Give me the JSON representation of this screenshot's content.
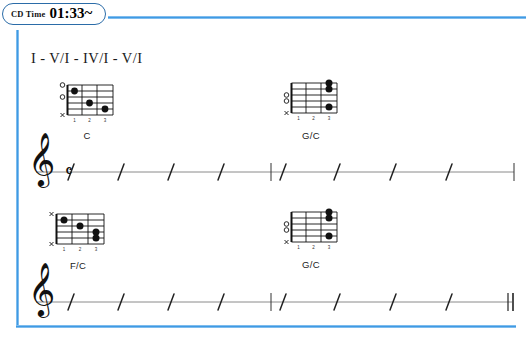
{
  "badge": {
    "label": "CD Time",
    "value": "01:33~",
    "icon": "cd-time-badge"
  },
  "colors": {
    "frame_blue": "#4da3e8",
    "ink": "#111111",
    "staff_line": "#8a8a8a"
  },
  "progression": {
    "text": "I - V/I - IV/I - V/I"
  },
  "chords": [
    {
      "name": "C",
      "row": 1,
      "position": "left",
      "markers": [
        "o",
        "o",
        "",
        "",
        "",
        "x"
      ],
      "fret_numbers": [
        "1",
        "2",
        "3"
      ],
      "dots": [
        {
          "string": 2,
          "fret": 1
        },
        {
          "string": 4,
          "fret": 2
        },
        {
          "string": 5,
          "fret": 3
        }
      ]
    },
    {
      "name": "G/C",
      "row": 1,
      "position": "right",
      "markers": [
        "",
        "",
        "o",
        "o",
        "",
        "x"
      ],
      "fret_numbers": [
        "1",
        "2",
        "3"
      ],
      "dots": [
        {
          "string": 1,
          "fret": 3
        },
        {
          "string": 2,
          "fret": 3
        },
        {
          "string": 5,
          "fret": 3
        }
      ]
    },
    {
      "name": "F/C",
      "row": 2,
      "position": "left",
      "markers": [
        "x",
        "",
        "",
        "",
        "",
        "x"
      ],
      "fret_numbers": [
        "1",
        "2",
        "3"
      ],
      "dots": [
        {
          "string": 2,
          "fret": 1
        },
        {
          "string": 3,
          "fret": 2
        },
        {
          "string": 4,
          "fret": 3
        },
        {
          "string": 5,
          "fret": 3
        }
      ]
    },
    {
      "name": "G/C",
      "row": 2,
      "position": "right",
      "markers": [
        "",
        "",
        "o",
        "o",
        "",
        "x"
      ],
      "fret_numbers": [
        "1",
        "2",
        "3"
      ],
      "dots": [
        {
          "string": 1,
          "fret": 3
        },
        {
          "string": 2,
          "fret": 3
        },
        {
          "string": 5,
          "fret": 3
        }
      ]
    }
  ],
  "staves": [
    {
      "index": 1,
      "clef": "treble-clef",
      "time_signature": "common-time",
      "measures": 2,
      "slashes_per_measure": 4,
      "start_barline": "none",
      "mid_barline": "single",
      "end_barline": "single"
    },
    {
      "index": 2,
      "clef": "treble-clef",
      "time_signature": "",
      "measures": 2,
      "slashes_per_measure": 4,
      "start_barline": "none",
      "mid_barline": "single",
      "end_barline": "double"
    }
  ]
}
